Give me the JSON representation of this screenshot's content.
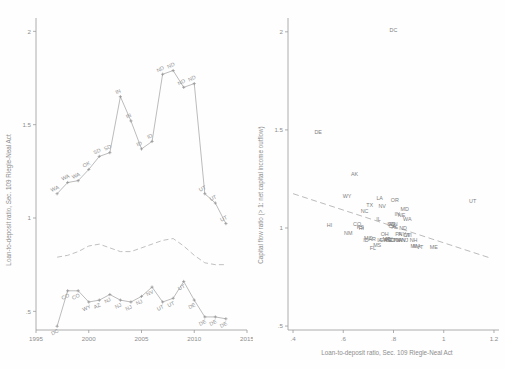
{
  "figure": {
    "background_color": "#ffffff",
    "line_color": "#a6a6a6",
    "text_color": "#8d8d8d"
  },
  "chart_data": [
    {
      "id": "left",
      "type": "line",
      "title": "",
      "xlabel": "",
      "ylabel": "Loan-to-deposit ratio, Sec. 109 Riegle-Neal Act",
      "xlim": [
        1995,
        2015
      ],
      "ylim": [
        0.4,
        2.05
      ],
      "xticks": [
        1995,
        2000,
        2005,
        2010,
        2015
      ],
      "xticklabels": [
        "1995",
        "2000",
        "2005",
        "2010",
        "2015"
      ],
      "yticks": [
        0.5,
        1,
        1.5,
        2
      ],
      "yticklabels": [
        ".5",
        "1",
        "1.5",
        "2"
      ],
      "grid": false,
      "legend_position": "none",
      "series": [
        {
          "name": "maximum",
          "style": "solid-with-markers",
          "x": [
            1997,
            1998,
            1999,
            2000,
            2001,
            2002,
            2003,
            2004,
            2005,
            2006,
            2007,
            2008,
            2009,
            2010,
            2011,
            2012,
            2013
          ],
          "values": [
            1.13,
            1.19,
            1.2,
            1.26,
            1.33,
            1.35,
            1.65,
            1.52,
            1.37,
            1.41,
            1.77,
            1.79,
            1.7,
            1.72,
            1.13,
            1.08,
            0.97
          ],
          "point_labels": [
            "WA",
            "WA",
            "WA",
            "OK",
            "SD",
            "SD",
            "IN",
            "IN",
            "ID",
            "ID",
            "ND",
            "ND",
            "ND",
            "ND",
            "UT",
            "UT",
            "UT"
          ]
        },
        {
          "name": "average",
          "style": "dashed",
          "x": [
            1997,
            1998,
            1999,
            2000,
            2001,
            2002,
            2003,
            2004,
            2005,
            2006,
            2007,
            2008,
            2009,
            2010,
            2011,
            2012,
            2013
          ],
          "values": [
            0.79,
            0.8,
            0.82,
            0.85,
            0.86,
            0.84,
            0.82,
            0.82,
            0.84,
            0.86,
            0.88,
            0.89,
            0.85,
            0.8,
            0.76,
            0.75,
            0.75
          ],
          "point_labels": []
        },
        {
          "name": "minimum",
          "style": "solid-with-markers",
          "x": [
            1997,
            1998,
            1999,
            2000,
            2001,
            2002,
            2003,
            2004,
            2005,
            2006,
            2007,
            2008,
            2009,
            2010,
            2011,
            2012,
            2013
          ],
          "values": [
            0.42,
            0.61,
            0.61,
            0.55,
            0.56,
            0.59,
            0.56,
            0.55,
            0.58,
            0.63,
            0.55,
            0.57,
            0.66,
            0.56,
            0.47,
            0.47,
            0.46
          ],
          "point_labels": [
            "DC",
            "CO",
            "CO",
            "WY",
            "AZ",
            "NJ",
            "NJ",
            "NJ",
            "NJ",
            "NV",
            "UT",
            "UT",
            "UT",
            "DE",
            "DE",
            "DE",
            "DE"
          ]
        }
      ]
    },
    {
      "id": "right",
      "type": "scatter",
      "title": "",
      "xlabel": "Loan-to-deposit ratio, Sec. 109 Riegle-Neal Act",
      "ylabel": "Capital flow ratio (> 1: net capital income outflow)",
      "xlim": [
        0.38,
        1.22
      ],
      "ylim": [
        0.48,
        2.05
      ],
      "xticks": [
        0.4,
        0.6,
        0.8,
        1.0,
        1.2
      ],
      "xticklabels": [
        ".4",
        ".6",
        ".8",
        "1",
        "1.2"
      ],
      "yticks": [
        0.5,
        1,
        1.5,
        2
      ],
      "yticklabels": [
        ".5",
        "1",
        "1.5",
        "2"
      ],
      "grid": false,
      "legend_position": "none",
      "fit_line": {
        "name": "linear fit",
        "style": "dashed",
        "x": [
          0.4,
          1.19
        ],
        "y": [
          1.175,
          0.845
        ]
      },
      "points": [
        {
          "label": "DC",
          "x": 0.8,
          "y": 2.0
        },
        {
          "label": "DE",
          "x": 0.5,
          "y": 1.48
        },
        {
          "label": "AK",
          "x": 0.645,
          "y": 1.265
        },
        {
          "label": "WY",
          "x": 0.615,
          "y": 1.155
        },
        {
          "label": "LA",
          "x": 0.745,
          "y": 1.145
        },
        {
          "label": "OR",
          "x": 0.805,
          "y": 1.13
        },
        {
          "label": "UT",
          "x": 1.115,
          "y": 1.125
        },
        {
          "label": "TX",
          "x": 0.705,
          "y": 1.105
        },
        {
          "label": "NV",
          "x": 0.755,
          "y": 1.1
        },
        {
          "label": "NC",
          "x": 0.685,
          "y": 1.075
        },
        {
          "label": "MD",
          "x": 0.845,
          "y": 1.085
        },
        {
          "label": "IN",
          "x": 0.815,
          "y": 1.06
        },
        {
          "label": "NE",
          "x": 0.832,
          "y": 1.058
        },
        {
          "label": "IL",
          "x": 0.74,
          "y": 1.035
        },
        {
          "label": "WA",
          "x": 0.855,
          "y": 1.035
        },
        {
          "label": "HI",
          "x": 0.545,
          "y": 1.005
        },
        {
          "label": "CO",
          "x": 0.655,
          "y": 1.01
        },
        {
          "label": "KS",
          "x": 0.668,
          "y": 0.995
        },
        {
          "label": "SD",
          "x": 0.79,
          "y": 1.01
        },
        {
          "label": "MN",
          "x": 0.8,
          "y": 1.008
        },
        {
          "label": "CA",
          "x": 0.795,
          "y": 1.0
        },
        {
          "label": "AL",
          "x": 0.805,
          "y": 0.995
        },
        {
          "label": "NM",
          "x": 0.62,
          "y": 0.965
        },
        {
          "label": "OH",
          "x": 0.765,
          "y": 0.96
        },
        {
          "label": "PA",
          "x": 0.82,
          "y": 0.96
        },
        {
          "label": "NY",
          "x": 0.835,
          "y": 0.958
        },
        {
          "label": "WI",
          "x": 0.86,
          "y": 0.955
        },
        {
          "label": "MO",
          "x": 0.7,
          "y": 0.94
        },
        {
          "label": "AR",
          "x": 0.715,
          "y": 0.933
        },
        {
          "label": "ID",
          "x": 0.69,
          "y": 0.928
        },
        {
          "label": "IA",
          "x": 0.745,
          "y": 0.93
        },
        {
          "label": "GA",
          "x": 0.76,
          "y": 0.928
        },
        {
          "label": "ME",
          "x": 0.778,
          "y": 0.928
        },
        {
          "label": "SC",
          "x": 0.79,
          "y": 0.928
        },
        {
          "label": "OK",
          "x": 0.8,
          "y": 0.928
        },
        {
          "label": "TN",
          "x": 0.812,
          "y": 0.928
        },
        {
          "label": "VA",
          "x": 0.822,
          "y": 0.928
        },
        {
          "label": "WV",
          "x": 0.833,
          "y": 0.928
        },
        {
          "label": "NJ",
          "x": 0.845,
          "y": 0.928
        },
        {
          "label": "NH",
          "x": 0.88,
          "y": 0.93
        },
        {
          "label": "MS",
          "x": 0.735,
          "y": 0.905
        },
        {
          "label": "FL",
          "x": 0.718,
          "y": 0.888
        },
        {
          "label": "MI",
          "x": 0.88,
          "y": 0.9
        },
        {
          "label": "MA",
          "x": 0.893,
          "y": 0.9
        },
        {
          "label": "VT",
          "x": 0.905,
          "y": 0.893
        },
        {
          "label": "ME",
          "x": 0.96,
          "y": 0.895
        },
        {
          "label": "RI",
          "x": 0.672,
          "y": 0.988
        },
        {
          "label": "CT",
          "x": 0.852,
          "y": 0.955
        },
        {
          "label": "MT",
          "x": 0.772,
          "y": 0.935
        },
        {
          "label": "KY",
          "x": 0.782,
          "y": 0.932
        },
        {
          "label": "ND",
          "x": 0.838,
          "y": 0.99
        }
      ]
    }
  ]
}
